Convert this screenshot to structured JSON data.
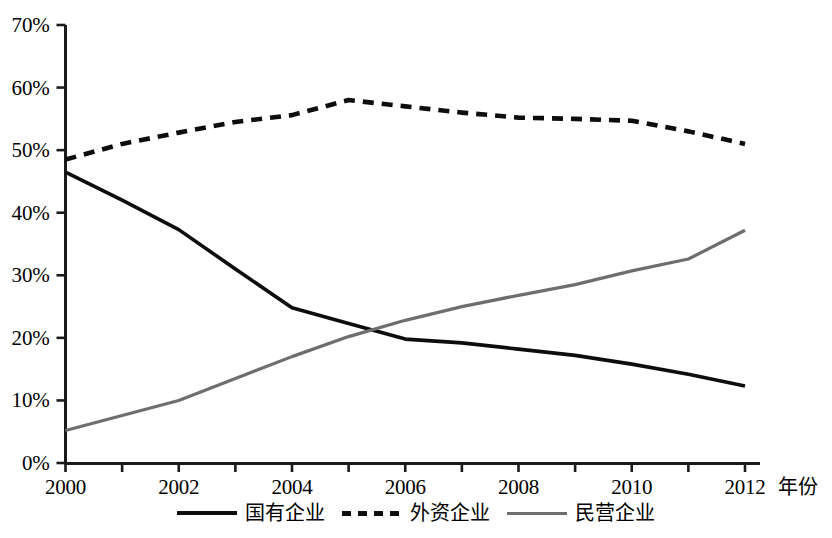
{
  "chart_data": {
    "type": "line",
    "title": "",
    "xlabel": "年份",
    "ylabel": "",
    "xlim": [
      2000,
      2012
    ],
    "ylim": [
      0,
      70
    ],
    "grid": false,
    "legend_position": "bottom",
    "x": [
      2000,
      2001,
      2002,
      2003,
      2004,
      2005,
      2006,
      2007,
      2008,
      2009,
      2010,
      2011,
      2012
    ],
    "x_tick_labels": [
      "2000",
      "2002",
      "2004",
      "2006",
      "2008",
      "2010",
      "2012"
    ],
    "x_tick_values": [
      2000,
      2002,
      2004,
      2006,
      2008,
      2010,
      2012
    ],
    "y_tick_labels": [
      "0%",
      "10%",
      "20%",
      "30%",
      "40%",
      "50%",
      "60%",
      "70%"
    ],
    "y_tick_values": [
      0,
      10,
      20,
      30,
      40,
      50,
      60,
      70
    ],
    "series": [
      {
        "name": "国有企业",
        "style": "solid",
        "color": "#0d0d0d",
        "values": [
          46.5,
          42.0,
          37.3,
          31.0,
          24.8,
          22.3,
          19.8,
          19.2,
          18.2,
          17.2,
          15.8,
          14.2,
          12.3
        ]
      },
      {
        "name": "外资企业",
        "style": "dashed",
        "color": "#0d0d0d",
        "values": [
          48.5,
          51.0,
          52.8,
          54.5,
          55.6,
          58.0,
          57.0,
          56.0,
          55.2,
          55.0,
          54.7,
          53.0,
          51.0
        ]
      },
      {
        "name": "民营企业",
        "style": "solid",
        "color": "#6e6e6e",
        "values": [
          5.2,
          7.6,
          10.0,
          13.5,
          17.0,
          20.2,
          22.8,
          25.0,
          26.8,
          28.5,
          30.7,
          32.6,
          37.2
        ]
      }
    ]
  },
  "axis": {
    "x_title": "年份"
  },
  "legend": {
    "items": [
      {
        "label": "国有企业",
        "swatch": "solid-black-line-icon"
      },
      {
        "label": "外资企业",
        "swatch": "dashed-black-line-icon"
      },
      {
        "label": "民营企业",
        "swatch": "solid-gray-line-icon"
      }
    ]
  }
}
